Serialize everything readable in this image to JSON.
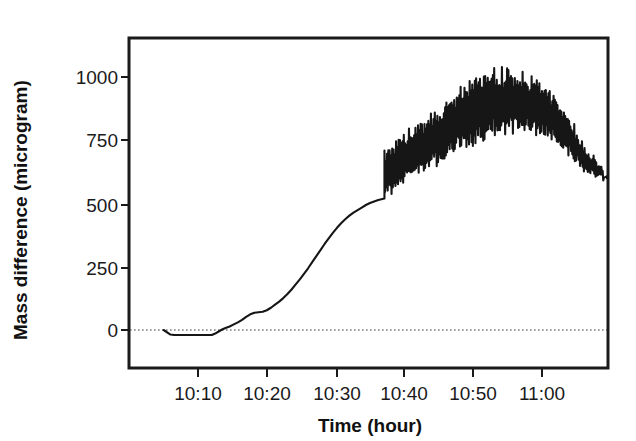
{
  "chart_data": {
    "type": "line",
    "title": "",
    "xlabel": "Time (hour)",
    "ylabel": "Mass difference (microgram)",
    "xlim": [
      "10:05",
      "11:14"
    ],
    "ylim": [
      -120,
      1130
    ],
    "grid": false,
    "legend": null,
    "x_tick_labels": [
      "10:10",
      "10:20",
      "10:30",
      "10:40",
      "10:50",
      "11:00"
    ],
    "x_tick_values": [
      10,
      20,
      30,
      40,
      50,
      60
    ],
    "y_tick_labels": [
      "0",
      "250",
      "500",
      "750",
      "1000"
    ],
    "y_tick_values": [
      0,
      250,
      500,
      750,
      1000
    ],
    "reference_lines": [
      {
        "name": "zero-baseline",
        "orientation": "horizontal",
        "value": 0,
        "style": "dotted"
      }
    ],
    "series": [
      {
        "name": "Mass difference",
        "color": "#161616",
        "x_unit": "minutes after 10:00",
        "description": "Baseline near 0 until ~10:14, smooth rise to ~520 ug by 10:37, then strongly oscillating signal rising to a peak near 1060 ug around 10:55-11:02, then decaying to ~600 ug by 11:14",
        "x": [
          5.0,
          6.0,
          6.5,
          7.0,
          8.0,
          9.0,
          10.0,
          11.0,
          12.0,
          12.5,
          13.0,
          13.5,
          14.0,
          14.6,
          15.2,
          15.8,
          16.4,
          17.0,
          17.6,
          18.2,
          18.8,
          19.4,
          20.0,
          20.6,
          21.2,
          21.8,
          22.4,
          23.0,
          23.6,
          24.2,
          24.8,
          25.4,
          26.0,
          26.6,
          27.2,
          27.8,
          28.4,
          29.0,
          29.6,
          30.2,
          30.8,
          31.4,
          32.0,
          32.6,
          33.2,
          33.8,
          34.4,
          35.0,
          35.6,
          36.2,
          36.8,
          37.1
        ],
        "y": [
          0,
          -18,
          -20,
          -20,
          -20,
          -20,
          -20,
          -20,
          -20,
          -14,
          -6,
          2,
          8,
          14,
          22,
          30,
          40,
          52,
          62,
          68,
          70,
          72,
          78,
          88,
          100,
          112,
          126,
          142,
          160,
          180,
          200,
          222,
          244,
          268,
          292,
          316,
          340,
          362,
          384,
          404,
          422,
          438,
          452,
          464,
          474,
          484,
          494,
          502,
          508,
          514,
          518,
          520
        ],
        "oscillation_phase": {
          "start_x": 37.1,
          "end_x": 69.0,
          "description": "dense high-frequency spikes; envelope mean rises from ~620 to ~900 then falls to ~620; spike tops reach ~1060 near x=55-62, troughs dip to ~540-760",
          "envelope_mean": [
            620,
            650,
            680,
            700,
            730,
            760,
            790,
            820,
            850,
            870,
            890,
            900,
            905,
            900,
            890,
            870,
            840,
            800,
            750,
            690,
            640,
            610
          ],
          "envelope_amplitude": [
            90,
            95,
            100,
            105,
            110,
            115,
            120,
            125,
            130,
            130,
            130,
            125,
            120,
            115,
            110,
            100,
            90,
            80,
            65,
            50,
            35,
            15
          ],
          "peak_value": 1060,
          "final_value": 600
        }
      }
    ]
  },
  "axes": {
    "y_axis_name": "mass-difference-axis",
    "x_axis_name": "time-axis"
  }
}
